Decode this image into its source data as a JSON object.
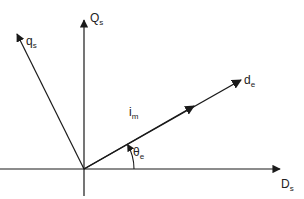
{
  "diagram": {
    "type": "vector-phasor-diagram",
    "colors": {
      "line": "#1a1a1a",
      "text": "#222222",
      "background": "#ffffff"
    },
    "origin": {
      "x": 84,
      "y": 169
    },
    "axes": [
      {
        "id": "Ds",
        "label_main": "D",
        "label_sub": "s",
        "direction": "horizontal-right"
      },
      {
        "id": "Qs",
        "label_main": "Q",
        "label_sub": "s",
        "direction": "vertical-up"
      }
    ],
    "vectors": [
      {
        "id": "qs",
        "label_main": "q",
        "label_sub": "s",
        "description": "rotated q-axis"
      },
      {
        "id": "de",
        "label_main": "d",
        "label_sub": "e",
        "description": "rotated d-axis"
      },
      {
        "id": "im",
        "label_main": "i",
        "label_sub": "m",
        "description": "magnetizing current along d-axis"
      }
    ],
    "angle": {
      "label_main": "θ",
      "label_sub": "e",
      "between": [
        "Ds",
        "de"
      ]
    }
  }
}
